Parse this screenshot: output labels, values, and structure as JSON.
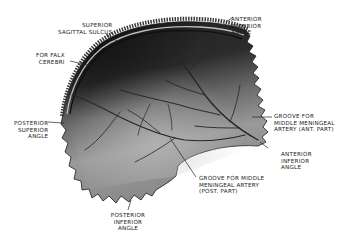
{
  "figure": {
    "colors": {
      "background": "#ffffff",
      "bone_dark": "#1e1e1e",
      "bone_mid": "#5a5a5a",
      "bone_light": "#a8a8a8",
      "groove": "#2a2a2a",
      "label_text": "#1a1a1a",
      "leader_line": "#222222"
    }
  },
  "labels": {
    "superior_sagittal_sulcus": {
      "line1": "Superior",
      "line2": "Sagittal Sulcus"
    },
    "for_falx_cerebri": {
      "line1": "For Falx",
      "line2": "Cerebri"
    },
    "anterior_superior_angle": {
      "line1": "Anterior",
      "line2": "Superior",
      "line3": "Angle"
    },
    "posterior_superior_angle": {
      "line1": "Posterior",
      "line2": "Superior",
      "line3": "Angle"
    },
    "groove_mma_ant": {
      "line1": "Groove For",
      "line2": "Middle Meningeal",
      "line3": "Artery (Ant. Part)"
    },
    "anterior_inferior_angle": {
      "line1": "Anterior",
      "line2": "Inferior",
      "line3": "Angle"
    },
    "groove_mma_post": {
      "line1": "Groove For Middle",
      "line2": "Meningeal Artery",
      "line3": "(Post. Part)"
    },
    "posterior_inferior_angle": {
      "line1": "Posterior",
      "line2": "Inferior",
      "line3": "Angle"
    }
  }
}
